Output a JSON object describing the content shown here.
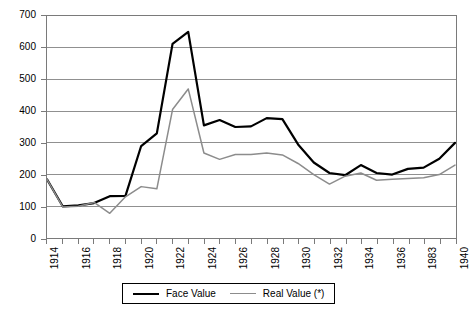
{
  "chart_data": {
    "type": "line",
    "title": "",
    "xlabel": "",
    "ylabel": "",
    "ylim": [
      0,
      700
    ],
    "ytick_step": 100,
    "grid": true,
    "legend_position": "bottom",
    "yticks": [
      "0",
      "100",
      "200",
      "300",
      "400",
      "500",
      "600",
      "700"
    ],
    "categories": [
      "1914",
      "1915",
      "1916",
      "1917",
      "1918",
      "1919",
      "1920",
      "1921",
      "1922",
      "1923",
      "1924",
      "1925",
      "1926",
      "1927",
      "1928",
      "1929",
      "1930",
      "1931",
      "1932",
      "1933",
      "1934",
      "1935",
      "1936",
      "1937",
      "1983",
      "1939",
      "1940"
    ],
    "xtick_labels_shown": [
      "1914",
      "1916",
      "1918",
      "1920",
      "1922",
      "1924",
      "1926",
      "1928",
      "1930",
      "1932",
      "1934",
      "1936",
      "1983",
      "1940"
    ],
    "series": [
      {
        "name": "Face Value",
        "color": "#000000",
        "width": 2.2,
        "values": [
          185,
          100,
          103,
          110,
          132,
          133,
          290,
          330,
          612,
          650,
          355,
          372,
          350,
          352,
          378,
          375,
          295,
          238,
          205,
          198,
          230,
          205,
          200,
          218,
          222,
          250,
          300
        ]
      },
      {
        "name": "Real Value (*)",
        "color": "#8c8c8c",
        "width": 1.5,
        "values": [
          185,
          98,
          100,
          112,
          78,
          130,
          162,
          155,
          405,
          470,
          268,
          248,
          263,
          263,
          268,
          262,
          235,
          200,
          170,
          195,
          205,
          182,
          185,
          188,
          190,
          200,
          230
        ]
      }
    ]
  },
  "legend": {
    "entries": [
      {
        "label": "Face Value",
        "icon": "line-swatch-black"
      },
      {
        "label": "Real Value (*)",
        "icon": "line-swatch-gray"
      }
    ]
  }
}
